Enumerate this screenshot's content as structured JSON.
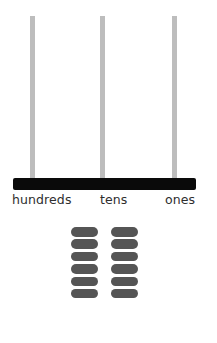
{
  "abacus": {
    "rods": [
      {
        "name": "hundreds",
        "left": 30
      },
      {
        "name": "tens",
        "left": 100
      },
      {
        "name": "ones",
        "left": 172
      }
    ],
    "labels": {
      "hundreds": "hundreds",
      "tens": "tens",
      "ones": "ones"
    },
    "rod_color": "#bdbdbd",
    "base_color": "#0a0a0a"
  },
  "bead_tray": {
    "columns": [
      {
        "bead_count": 6
      },
      {
        "bead_count": 6
      }
    ],
    "bead_color": "#555555",
    "total_beads": 12
  }
}
